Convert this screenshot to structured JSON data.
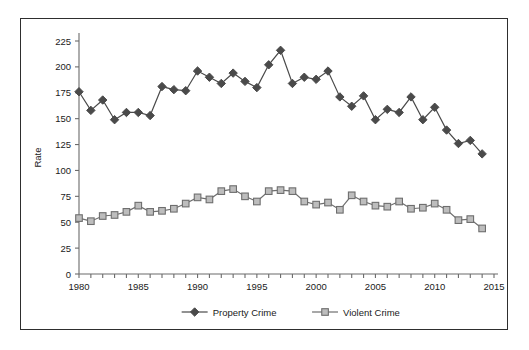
{
  "chart_data": {
    "type": "line",
    "title": "",
    "subtitle": "",
    "xlabel": "",
    "ylabel": "Rate",
    "xlim": [
      1980,
      2015
    ],
    "ylim": [
      0,
      225
    ],
    "grid": false,
    "legend_position": "bottom",
    "x": [
      1980,
      1981,
      1982,
      1983,
      1984,
      1985,
      1986,
      1987,
      1988,
      1989,
      1990,
      1991,
      1992,
      1993,
      1994,
      1995,
      1996,
      1997,
      1998,
      1999,
      2000,
      2001,
      2002,
      2003,
      2004,
      2005,
      2006,
      2007,
      2008,
      2009,
      2010,
      2011,
      2012,
      2013,
      2014
    ],
    "x_tick_labels": [
      "1980",
      "1985",
      "1990",
      "1995",
      "2000",
      "2005",
      "2010",
      "2015"
    ],
    "x_tick_values": [
      1980,
      1985,
      1990,
      1995,
      2000,
      2005,
      2010,
      2015
    ],
    "y_tick_labels": [
      "0",
      "25",
      "50",
      "75",
      "100",
      "125",
      "150",
      "175",
      "200",
      "225"
    ],
    "y_tick_values": [
      0,
      25,
      50,
      75,
      100,
      125,
      150,
      175,
      200,
      225
    ],
    "series": [
      {
        "name": "Property Crime",
        "marker": "diamond",
        "color": "#4a4a4a",
        "marker_fill": "#4a4a4a",
        "values": [
          176,
          158,
          168,
          149,
          156,
          156,
          153,
          181,
          178,
          177,
          196,
          190,
          184,
          194,
          186,
          180,
          202,
          216,
          184,
          190,
          188,
          196,
          171,
          162,
          172,
          149,
          159,
          156,
          171,
          149,
          161,
          139,
          126,
          129,
          116
        ]
      },
      {
        "name": "Violent Crime",
        "marker": "square",
        "color": "#6e6e6e",
        "marker_fill": "#bdbdbd",
        "values": [
          54,
          51,
          56,
          57,
          60,
          66,
          60,
          61,
          63,
          68,
          74,
          72,
          80,
          82,
          75,
          70,
          80,
          81,
          80,
          70,
          67,
          69,
          62,
          76,
          70,
          66,
          65,
          70,
          63,
          64,
          68,
          62,
          52,
          53,
          44
        ]
      }
    ]
  },
  "legend": {
    "items": [
      {
        "label": "Property Crime"
      },
      {
        "label": "Violent Crime"
      }
    ]
  },
  "axes": {
    "y_axis_title": "Rate"
  }
}
